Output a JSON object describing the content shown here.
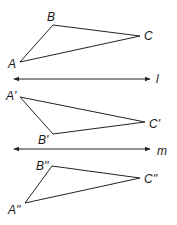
{
  "diagram": {
    "triangles": [
      {
        "name": "ABC",
        "vertices": [
          {
            "label": "A",
            "point": [
              20,
              62
            ]
          },
          {
            "label": "B",
            "point": [
              53,
              25
            ]
          },
          {
            "label": "C",
            "point": [
              140,
              36
            ]
          }
        ]
      },
      {
        "name": "A'B'C'",
        "vertices": [
          {
            "label": "A'",
            "point": [
              20,
              97
            ]
          },
          {
            "label": "B'",
            "point": [
              53,
              134
            ]
          },
          {
            "label": "C'",
            "point": [
              145,
              122
            ]
          }
        ]
      },
      {
        "name": "A''B''C''",
        "vertices": [
          {
            "label": "A''",
            "point": [
              25,
              203
            ]
          },
          {
            "label": "B''",
            "point": [
              52,
              166
            ]
          },
          {
            "label": "C''",
            "point": [
              140,
              178
            ]
          }
        ]
      }
    ],
    "lines": [
      {
        "label": "l",
        "type": "double-arrow"
      },
      {
        "label": "m",
        "type": "double-arrow"
      }
    ]
  }
}
